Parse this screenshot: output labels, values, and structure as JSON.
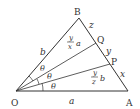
{
  "diagram": {
    "type": "triangle-angle-trisection",
    "vertices": {
      "O": {
        "label": "O"
      },
      "A": {
        "label": "A"
      },
      "B": {
        "label": "B"
      },
      "P": {
        "label": "P"
      },
      "Q": {
        "label": "Q"
      }
    },
    "side_labels": {
      "OA": "a",
      "OB": "b",
      "AP": "x",
      "PQ": "y",
      "QB": "z"
    },
    "segment_labels": {
      "OQ": {
        "num": "y",
        "den": "x",
        "var": "a"
      },
      "OP": {
        "num": "y",
        "den": "z",
        "var": "b"
      }
    },
    "angle_label": "θ",
    "angle_count": 3,
    "line_color": "#333333"
  }
}
